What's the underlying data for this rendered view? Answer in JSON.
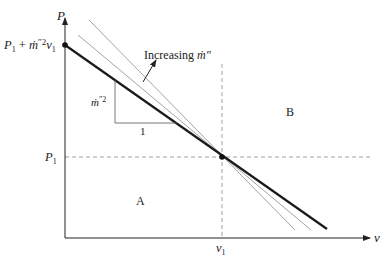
{
  "axes": {
    "y_label": "P",
    "x_label": "v"
  },
  "labels": {
    "intercept_P": "P",
    "intercept_sub": "1",
    "intercept_plus": " + ",
    "intercept_m": "ṁ",
    "intercept_pp": "″",
    "intercept_sq": "2",
    "intercept_v": "v",
    "intercept_vsub": "1",
    "p1": "P",
    "p1_sub": "1",
    "v1": "v",
    "v1_sub": "1",
    "increasing_text": "Increasing ",
    "increasing_m": "ṁ″",
    "slope_m": "ṁ",
    "slope_pp": "″",
    "slope_sq": "2",
    "slope_run": "1",
    "region_a": "A",
    "region_b": "B"
  },
  "colors": {
    "axis": "#222222",
    "thick_line": "#1a1a1a",
    "thin_line": "#999999",
    "dashed": "#888888"
  }
}
